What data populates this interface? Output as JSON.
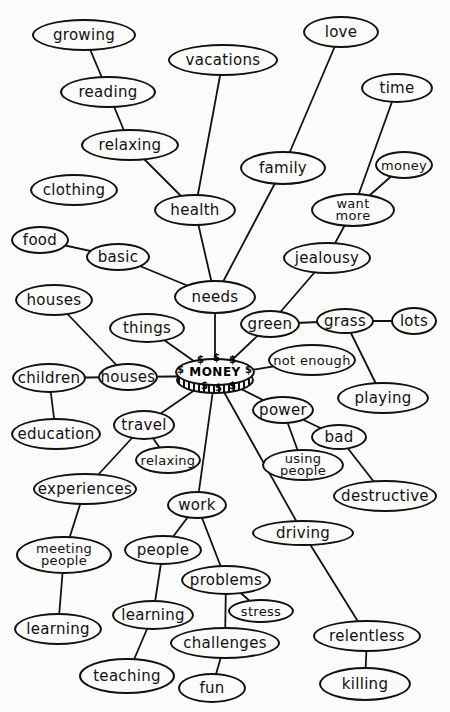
{
  "diagram": {
    "title": "MONEY",
    "center": {
      "label": "MONEY",
      "x": 215,
      "y": 376,
      "symbol": "$"
    },
    "nodes": [
      {
        "id": "growing",
        "label": "growing",
        "x": 84,
        "y": 35,
        "w": 104,
        "h": 32
      },
      {
        "id": "vacations",
        "label": "vacations",
        "x": 223,
        "y": 60,
        "w": 110,
        "h": 32
      },
      {
        "id": "love",
        "label": "love",
        "x": 341,
        "y": 32,
        "w": 76,
        "h": 32
      },
      {
        "id": "reading",
        "label": "reading",
        "x": 108,
        "y": 92,
        "w": 96,
        "h": 32
      },
      {
        "id": "time",
        "label": "time",
        "x": 397,
        "y": 88,
        "w": 72,
        "h": 30
      },
      {
        "id": "relaxing-top",
        "label": "relaxing",
        "x": 130,
        "y": 145,
        "w": 98,
        "h": 32
      },
      {
        "id": "family",
        "label": "family",
        "x": 283,
        "y": 168,
        "w": 86,
        "h": 34
      },
      {
        "id": "money-small",
        "label": "money",
        "x": 404,
        "y": 165,
        "w": 58,
        "h": 28,
        "cls": "small"
      },
      {
        "id": "clothing",
        "label": "clothing",
        "x": 74,
        "y": 190,
        "w": 88,
        "h": 32
      },
      {
        "id": "health",
        "label": "health",
        "x": 195,
        "y": 210,
        "w": 82,
        "h": 32
      },
      {
        "id": "want-more",
        "label": "want\nmore",
        "x": 353,
        "y": 210,
        "w": 84,
        "h": 34,
        "cls": "two"
      },
      {
        "id": "food",
        "label": "food",
        "x": 40,
        "y": 240,
        "w": 58,
        "h": 28
      },
      {
        "id": "basic",
        "label": "basic",
        "x": 118,
        "y": 257,
        "w": 64,
        "h": 28
      },
      {
        "id": "jealousy",
        "label": "jealousy",
        "x": 327,
        "y": 258,
        "w": 88,
        "h": 32
      },
      {
        "id": "houses-top",
        "label": "houses",
        "x": 54,
        "y": 300,
        "w": 78,
        "h": 32
      },
      {
        "id": "needs",
        "label": "needs",
        "x": 215,
        "y": 297,
        "w": 82,
        "h": 34
      },
      {
        "id": "things",
        "label": "things",
        "x": 147,
        "y": 328,
        "w": 76,
        "h": 30
      },
      {
        "id": "green",
        "label": "green",
        "x": 270,
        "y": 324,
        "w": 60,
        "h": 28
      },
      {
        "id": "grass",
        "label": "grass",
        "x": 345,
        "y": 321,
        "w": 58,
        "h": 26
      },
      {
        "id": "lots",
        "label": "lots",
        "x": 414,
        "y": 321,
        "w": 46,
        "h": 28
      },
      {
        "id": "children",
        "label": "children",
        "x": 49,
        "y": 378,
        "w": 74,
        "h": 30
      },
      {
        "id": "houses",
        "label": "houses",
        "x": 128,
        "y": 377,
        "w": 60,
        "h": 28
      },
      {
        "id": "not-enough",
        "label": "not enough",
        "x": 312,
        "y": 360,
        "w": 88,
        "h": 32,
        "cls": "small"
      },
      {
        "id": "playing",
        "label": "playing",
        "x": 383,
        "y": 398,
        "w": 92,
        "h": 32
      },
      {
        "id": "power",
        "label": "power",
        "x": 283,
        "y": 410,
        "w": 62,
        "h": 28
      },
      {
        "id": "education",
        "label": "education",
        "x": 56,
        "y": 434,
        "w": 90,
        "h": 32
      },
      {
        "id": "travel",
        "label": "travel",
        "x": 144,
        "y": 425,
        "w": 62,
        "h": 30
      },
      {
        "id": "bad",
        "label": "bad",
        "x": 339,
        "y": 437,
        "w": 56,
        "h": 26
      },
      {
        "id": "relaxing",
        "label": "relaxing",
        "x": 168,
        "y": 460,
        "w": 66,
        "h": 28,
        "cls": "small"
      },
      {
        "id": "using-people",
        "label": "using\npeople",
        "x": 303,
        "y": 465,
        "w": 82,
        "h": 32,
        "cls": "two"
      },
      {
        "id": "experiences",
        "label": "experiences",
        "x": 85,
        "y": 489,
        "w": 104,
        "h": 32
      },
      {
        "id": "destructive",
        "label": "destructive",
        "x": 385,
        "y": 496,
        "w": 104,
        "h": 32
      },
      {
        "id": "work",
        "label": "work",
        "x": 197,
        "y": 505,
        "w": 60,
        "h": 28
      },
      {
        "id": "driving",
        "label": "driving",
        "x": 303,
        "y": 533,
        "w": 102,
        "h": 26
      },
      {
        "id": "meeting-people",
        "label": "meeting\npeople",
        "x": 64,
        "y": 555,
        "w": 96,
        "h": 38,
        "cls": "two"
      },
      {
        "id": "people",
        "label": "people",
        "x": 163,
        "y": 550,
        "w": 78,
        "h": 30
      },
      {
        "id": "problems",
        "label": "problems",
        "x": 226,
        "y": 580,
        "w": 90,
        "h": 30
      },
      {
        "id": "stress",
        "label": "stress",
        "x": 261,
        "y": 611,
        "w": 66,
        "h": 24,
        "cls": "small"
      },
      {
        "id": "learning-left",
        "label": "learning",
        "x": 58,
        "y": 629,
        "w": 88,
        "h": 32
      },
      {
        "id": "learning",
        "label": "learning",
        "x": 153,
        "y": 615,
        "w": 82,
        "h": 30
      },
      {
        "id": "challenges",
        "label": "challenges",
        "x": 225,
        "y": 643,
        "w": 110,
        "h": 32
      },
      {
        "id": "relentless",
        "label": "relentless",
        "x": 367,
        "y": 636,
        "w": 108,
        "h": 32
      },
      {
        "id": "teaching",
        "label": "teaching",
        "x": 127,
        "y": 676,
        "w": 96,
        "h": 36
      },
      {
        "id": "fun",
        "label": "fun",
        "x": 212,
        "y": 688,
        "w": 68,
        "h": 30
      },
      {
        "id": "killing",
        "label": "killing",
        "x": 365,
        "y": 684,
        "w": 92,
        "h": 34
      }
    ],
    "edges": [
      [
        "growing",
        "reading"
      ],
      [
        "reading",
        "relaxing-top"
      ],
      [
        "relaxing-top",
        "health"
      ],
      [
        "vacations",
        "health"
      ],
      [
        "health",
        "needs"
      ],
      [
        "love",
        "family"
      ],
      [
        "family",
        "needs"
      ],
      [
        "food",
        "basic"
      ],
      [
        "basic",
        "needs"
      ],
      [
        "needs",
        "center"
      ],
      [
        "time",
        "want-more"
      ],
      [
        "money-small",
        "want-more"
      ],
      [
        "want-more",
        "jealousy"
      ],
      [
        "jealousy",
        "green"
      ],
      [
        "green",
        "grass"
      ],
      [
        "grass",
        "lots"
      ],
      [
        "grass",
        "playing"
      ],
      [
        "green",
        "center"
      ],
      [
        "houses-top",
        "houses"
      ],
      [
        "children",
        "houses"
      ],
      [
        "children",
        "education"
      ],
      [
        "houses",
        "center"
      ],
      [
        "things",
        "center"
      ],
      [
        "not-enough",
        "center"
      ],
      [
        "power",
        "center"
      ],
      [
        "power",
        "bad"
      ],
      [
        "power",
        "using-people"
      ],
      [
        "bad",
        "destructive"
      ],
      [
        "travel",
        "center"
      ],
      [
        "travel",
        "relaxing"
      ],
      [
        "travel",
        "experiences"
      ],
      [
        "experiences",
        "meeting-people"
      ],
      [
        "meeting-people",
        "learning-left"
      ],
      [
        "work",
        "center"
      ],
      [
        "work",
        "people"
      ],
      [
        "work",
        "problems"
      ],
      [
        "people",
        "learning"
      ],
      [
        "learning",
        "teaching"
      ],
      [
        "problems",
        "stress"
      ],
      [
        "problems",
        "challenges"
      ],
      [
        "challenges",
        "fun"
      ],
      [
        "driving",
        "center"
      ],
      [
        "driving",
        "relentless"
      ],
      [
        "relentless",
        "killing"
      ]
    ],
    "colors": {
      "ink": "#111111",
      "paper": "#fbfbf9"
    }
  }
}
